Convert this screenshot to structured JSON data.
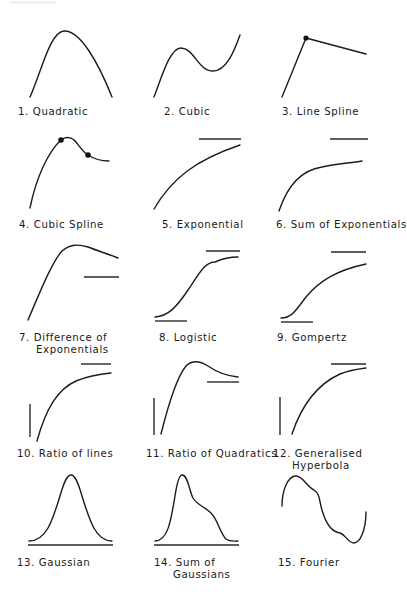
{
  "figure": {
    "panels": [
      {
        "id": 1,
        "label": "1.  Quadratic",
        "curve": "quadratic"
      },
      {
        "id": 2,
        "label": "2. Cubic",
        "curve": "cubic"
      },
      {
        "id": 3,
        "label": "3. Line Spline",
        "curve": "line-spline",
        "knots": 1
      },
      {
        "id": 4,
        "label": "4. Cubic  Spline",
        "curve": "cubic-spline",
        "knots": 2
      },
      {
        "id": 5,
        "label": "5.  Exponential",
        "curve": "exponential",
        "asymptotes": [
          "upper"
        ]
      },
      {
        "id": 6,
        "label": "6.  Sum of Exponentials",
        "curve": "sum-of-exponentials",
        "asymptotes": [
          "upper"
        ]
      },
      {
        "id": 7,
        "label": "7.  Difference of",
        "label_line2": "Exponentials",
        "curve": "difference-of-exponentials",
        "asymptotes": [
          "lower-right"
        ]
      },
      {
        "id": 8,
        "label": "8.  Logistic",
        "curve": "logistic",
        "asymptotes": [
          "upper",
          "lower"
        ]
      },
      {
        "id": 9,
        "label": "9.  Gompertz",
        "curve": "gompertz",
        "asymptotes": [
          "upper",
          "lower"
        ]
      },
      {
        "id": 10,
        "label": "10.  Ratio of  lines",
        "curve": "ratio-of-lines",
        "asymptotes": [
          "vertical",
          "upper"
        ]
      },
      {
        "id": 11,
        "label": "11. Ratio of Quadratics",
        "curve": "ratio-of-quadratics",
        "asymptotes": [
          "vertical",
          "lower-right"
        ]
      },
      {
        "id": 12,
        "label": "12.  Generalised",
        "label_line2": "Hyperbola",
        "curve": "generalised-hyperbola",
        "asymptotes": [
          "vertical",
          "upper"
        ]
      },
      {
        "id": 13,
        "label": "13.  Gaussian",
        "curve": "gaussian",
        "baseline": true
      },
      {
        "id": 14,
        "label": "14.   Sum  of",
        "label_line2": "Gaussians",
        "curve": "sum-of-gaussians",
        "baseline": true
      },
      {
        "id": 15,
        "label": "15.  Fourier",
        "curve": "fourier"
      }
    ]
  },
  "style": {
    "line_color": "#1c1c1c",
    "background": "#ffffff"
  }
}
